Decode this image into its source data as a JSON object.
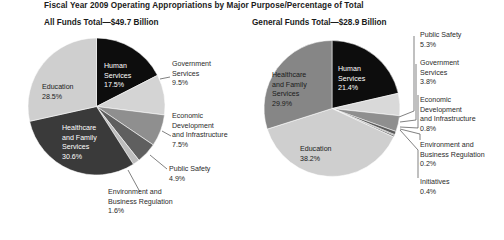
{
  "header": {
    "title": "Fiscal Year 2009 Operating Appropriations by Major Purpose/Percentage of Total",
    "left_subtitle": "All Funds Total—$49.7 Billion",
    "right_subtitle": "General Funds Total—$28.9 Billion"
  },
  "chart_data": [
    {
      "type": "pie",
      "title": "All Funds Total—$49.7 Billion",
      "total_label": "$49.7 Billion",
      "unit": "percent",
      "legend": "none",
      "grid": false,
      "categories": [
        "Human Services",
        "Government Services",
        "Economic Development and Infrastructure",
        "Public Safety",
        "Environment and Business Regulation",
        "Healthcare and Family Services",
        "Education"
      ],
      "values": [
        17.5,
        9.5,
        7.5,
        4.9,
        1.6,
        30.6,
        28.5
      ],
      "value_labels": [
        "17.5%",
        "9.5%",
        "7.5%",
        "4.9%",
        "1.6%",
        "30.6%",
        "28.5%"
      ],
      "colors": [
        "#0d0d0d",
        "#d4d4d4",
        "#8f8f8f",
        "#5f5f5f",
        "#bdbdbd",
        "#3a3a3a",
        "#cfcfcf"
      ],
      "label_placement": [
        "inside",
        "outside",
        "outside",
        "outside",
        "outside",
        "inside",
        "inside"
      ]
    },
    {
      "type": "pie",
      "title": "General Funds Total—$28.9 Billion",
      "total_label": "$28.9 Billion",
      "unit": "percent",
      "legend": "none",
      "grid": false,
      "categories": [
        "Human Services",
        "Public Safety",
        "Government Services",
        "Economic Development and Infrastructure",
        "Environment and Business Regulation",
        "Initiatives",
        "Education",
        "Healthcare and Family Services"
      ],
      "values": [
        21.4,
        5.3,
        3.8,
        0.8,
        0.2,
        0.4,
        38.2,
        29.9
      ],
      "value_labels": [
        "21.4%",
        "5.3%",
        "3.8%",
        "0.8%",
        "0.2%",
        "0.4%",
        "38.2%",
        "29.9%"
      ],
      "colors": [
        "#0d0d0d",
        "#d9d9d9",
        "#8f8f8f",
        "#5a5a5a",
        "#2a2a2a",
        "#777777",
        "#cfcfcf",
        "#868686"
      ],
      "label_placement": [
        "inside",
        "outside",
        "outside",
        "outside",
        "outside",
        "outside",
        "inside",
        "inside"
      ]
    }
  ],
  "left_chart": {
    "inside_labels": [
      {
        "name": "human-services",
        "l1": "Human",
        "l2": "Services",
        "l3": "17.5%"
      },
      {
        "name": "education",
        "l1": "Education",
        "l2": "28.5%"
      },
      {
        "name": "healthcare-and-family-services",
        "l1": "Healthcare",
        "l2": "and Family",
        "l3": "Services",
        "l4": "30.6%"
      }
    ],
    "callouts": [
      {
        "name": "government-services",
        "l1": "Government",
        "l2": "Services",
        "l3": "9.5%"
      },
      {
        "name": "economic-development-and-infrastructure",
        "l1": "Economic",
        "l2": "Development",
        "l3": "and Infrastructure",
        "l4": "7.5%"
      },
      {
        "name": "public-safety",
        "l1": "Public Safety",
        "l2": "4.9%"
      },
      {
        "name": "environment-and-business-regulation",
        "l1": "Environment and",
        "l2": "Business Regulation",
        "l3": "1.6%"
      }
    ]
  },
  "right_chart": {
    "inside_labels": [
      {
        "name": "human-services",
        "l1": "Human",
        "l2": "Services",
        "l3": "21.4%"
      },
      {
        "name": "healthcare-and-family-services",
        "l1": "Healthcare",
        "l2": "and Family",
        "l3": "Services",
        "l4": "29.9%"
      },
      {
        "name": "education",
        "l1": "Education",
        "l2": "38.2%"
      }
    ],
    "callouts": [
      {
        "name": "public-safety",
        "l1": "Public Safety",
        "l2": "5.3%"
      },
      {
        "name": "government-services",
        "l1": "Government",
        "l2": "Services",
        "l3": "3.8%"
      },
      {
        "name": "economic-development-and-infrastructure",
        "l1": "Economic",
        "l2": "Development",
        "l3": "and Infrastructure",
        "l4": "0.8%"
      },
      {
        "name": "environment-and-business-regulation",
        "l1": "Environment and",
        "l2": "Business Regulation",
        "l3": "0.2%"
      },
      {
        "name": "initiatives",
        "l1": "Initiatives",
        "l2": "0.4%"
      }
    ]
  }
}
